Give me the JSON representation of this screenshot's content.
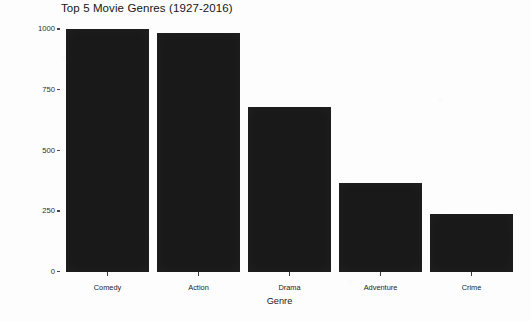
{
  "chart_data": {
    "type": "bar",
    "title": "Top 5 Movie Genres (1927-2016)",
    "xlabel": "Genre",
    "ylabel": "Number of Movies",
    "categories": [
      "Comedy",
      "Action",
      "Drama",
      "Adventure",
      "Crime"
    ],
    "values": [
      1000,
      985,
      680,
      368,
      238
    ],
    "ylim": [
      0,
      1030
    ],
    "ytick_labels": [
      "0",
      "250",
      "500",
      "750",
      "1000"
    ],
    "ytick_values": [
      0,
      250,
      500,
      750,
      1000
    ],
    "grid": false,
    "legend": "none",
    "bar_color": "#191919",
    "background_color": "#fdfdfd",
    "text_color": "#1c1c1c"
  }
}
